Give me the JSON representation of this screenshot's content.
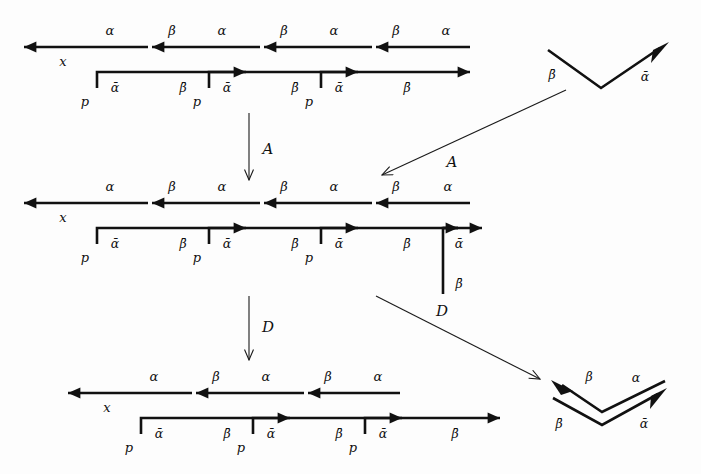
{
  "figure": {
    "background_color": "#fdfdfd",
    "ink_color": "#111111",
    "labels": {
      "alpha": "α",
      "beta": "β",
      "alpha_bar": "ᾱ̄",
      "beta_bar": "β̄",
      "x": "x",
      "p": "p",
      "op_a": "A",
      "op_d": "D"
    }
  },
  "symbols": {
    "alpha": "α",
    "beta": "β",
    "alpha_bar": "ᾱ",
    "beta_bar": "β̄",
    "x": "x",
    "p": "p",
    "A": "A",
    "D": "D"
  },
  "diagrams": [
    {
      "id": "top-left-strip",
      "name": "strip-diagram-1",
      "position": "top-left",
      "cells": 3,
      "end_label": "x",
      "corner_label": "p",
      "top_labels": [
        "α",
        "β",
        "α",
        "β",
        "α",
        "β",
        "α"
      ],
      "bottom_labels": [
        "ᾱ",
        "β̄",
        "ᾱ",
        "β̄",
        "ᾱ",
        "β̄"
      ],
      "right_tail": false
    },
    {
      "id": "middle-left-strip",
      "name": "strip-diagram-2",
      "position": "middle-left",
      "cells": 3,
      "end_label": "x",
      "corner_label": "p",
      "top_labels": [
        "α",
        "β",
        "α",
        "β",
        "α",
        "β",
        "α"
      ],
      "bottom_labels": [
        "ᾱ",
        "β̄",
        "ᾱ",
        "β̄",
        "ᾱ",
        "β̄"
      ],
      "right_tail": true,
      "right_tail_labels": [
        "ᾱ",
        "β̄"
      ]
    },
    {
      "id": "bottom-left-strip",
      "name": "strip-diagram-3",
      "position": "bottom-left",
      "cells": 3,
      "end_label": "x",
      "corner_label": "p",
      "top_labels": [
        "α",
        "β",
        "α",
        "β",
        "α"
      ],
      "bottom_labels": [
        "ᾱ",
        "β̄",
        "ᾱ",
        "β̄",
        "ᾱ",
        "β̄"
      ],
      "right_tail": false
    },
    {
      "id": "top-right-chevron",
      "name": "chevron-single",
      "position": "top-right",
      "arms": [
        {
          "label": "β̄",
          "side": "left",
          "arrowhead": false
        },
        {
          "label": "ᾱ",
          "side": "right",
          "arrowhead": true
        }
      ]
    },
    {
      "id": "bottom-right-chevron",
      "name": "chevron-double",
      "position": "bottom-right",
      "arms": [
        {
          "label": "β",
          "side": "upper-left",
          "arrowhead": true
        },
        {
          "label": "α",
          "side": "upper-right",
          "arrowhead": false
        },
        {
          "label": "β̄",
          "side": "lower-left",
          "arrowhead": false
        },
        {
          "label": "ᾱ",
          "side": "lower-right",
          "arrowhead": true
        }
      ]
    }
  ],
  "operations": [
    {
      "id": "op-a-vertical",
      "name": "operation-arrow-a-vertical",
      "label": "A",
      "from": "strip-diagram-1",
      "to": "strip-diagram-2",
      "direction": "down"
    },
    {
      "id": "op-a-diagonal",
      "name": "operation-arrow-a-diagonal",
      "label": "A",
      "from": "chevron-single",
      "to": "strip-diagram-2",
      "direction": "down-left"
    },
    {
      "id": "op-d-vertical",
      "name": "operation-arrow-d-vertical",
      "label": "D",
      "from": "strip-diagram-2",
      "to": "strip-diagram-3",
      "direction": "down"
    },
    {
      "id": "op-d-diagonal",
      "name": "operation-arrow-d-diagonal",
      "label": "D",
      "from": "strip-diagram-2",
      "to": "chevron-double",
      "direction": "down-right"
    }
  ]
}
